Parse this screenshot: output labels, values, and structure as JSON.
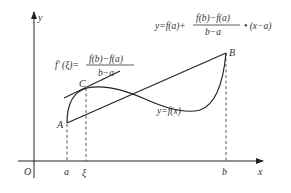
{
  "diagram": {
    "colors": {
      "stroke": "#222222",
      "text": "#333333",
      "background": "#ffffff"
    },
    "axes": {
      "x_label": "x",
      "y_label": "y",
      "origin_label": "O"
    },
    "points": {
      "A": "A",
      "B": "B",
      "C": "C"
    },
    "x_ticks": {
      "a": "a",
      "xi": "ξ",
      "b": "b"
    },
    "curve_label": "y=f(x)",
    "secant_equation": {
      "lhs": "y=f(a)+",
      "numerator": "f(b)−f(a)",
      "denominator": "b−a",
      "rhs": "• (x−a)"
    },
    "derivative_equation": {
      "lhs": "f′ (ξ)=",
      "numerator": "f(b)−f(a)",
      "denominator": "b−a"
    }
  }
}
